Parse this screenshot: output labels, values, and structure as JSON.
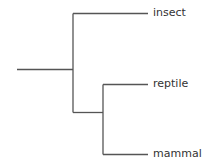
{
  "diagram": {
    "type": "phylogenetic-tree",
    "line_color": "#555555",
    "leaves": [
      {
        "label": "insect"
      },
      {
        "label": "reptile"
      },
      {
        "label": "mammal"
      }
    ]
  }
}
